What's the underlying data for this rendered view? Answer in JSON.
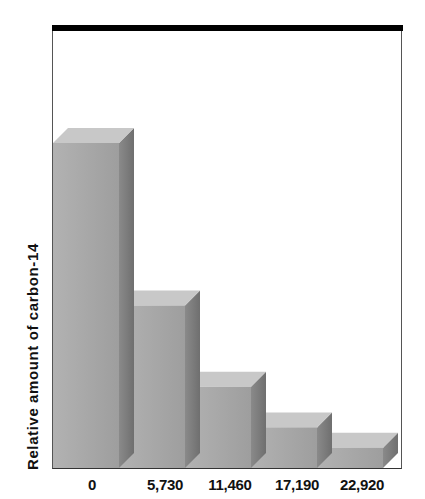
{
  "chart_data": {
    "type": "bar",
    "title": "",
    "xlabel": "",
    "ylabel": "Relative amount of carbon-14",
    "categories": [
      "0",
      "5,730",
      "11,460",
      "17,190",
      "22,920"
    ],
    "values": [
      1,
      0.5,
      0.25,
      0.125,
      0.0625
    ],
    "ylim": [
      0,
      1.1
    ],
    "grid": false,
    "legend": null,
    "style": "3d-bars",
    "colors": {
      "front": "#a8a8a8",
      "top": "#c8c8c8",
      "side": "#7e7e7e",
      "frame_top": "#000000"
    }
  },
  "axis": {
    "ylabel": "Relative amount of carbon-14",
    "xticks": [
      "0",
      "5,730",
      "11,460",
      "17,190",
      "22,920"
    ]
  }
}
